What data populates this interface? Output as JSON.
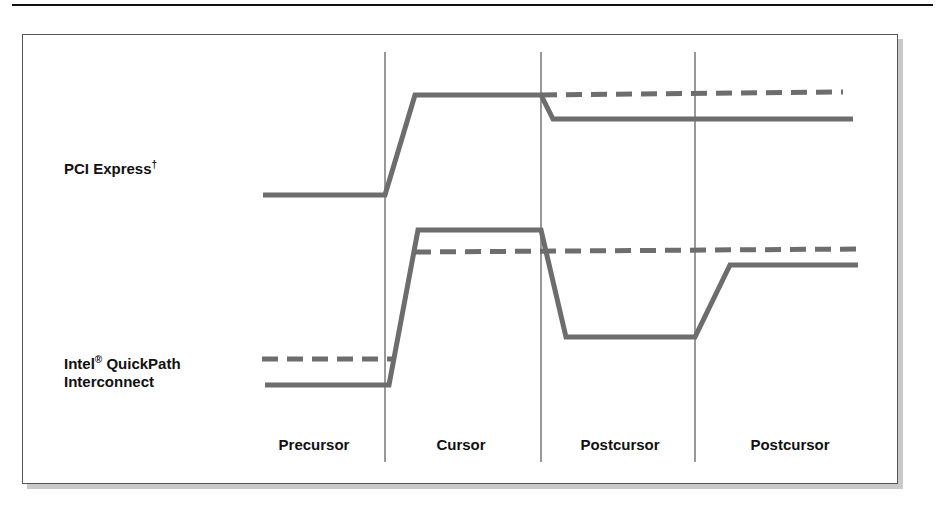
{
  "diagram": {
    "row_labels": {
      "pcie_main": "PCI Express",
      "pcie_sup": "†",
      "qpi_line1_main": "Intel",
      "qpi_line1_sup": "®",
      "qpi_line1_rest": " QuickPath",
      "qpi_line2": "Interconnect"
    },
    "columns": [
      {
        "label": "Precursor"
      },
      {
        "label": "Cursor"
      },
      {
        "label": "Postcursor"
      },
      {
        "label": "Postcursor"
      }
    ],
    "dividers_x": [
      385,
      541,
      695
    ],
    "colors": {
      "waveform": "#6d6d6d",
      "divider": "#333333",
      "frame_border": "#555555",
      "frame_shadow": "#c9c9c9",
      "text": "#111111"
    },
    "waveforms": {
      "pcie_solid": "263,195 385,195 415,95 541,95 553,119 853,119",
      "pcie_dashed": "541,95 843,92",
      "qpi_solid": "265,385 389,385 418,230 541,230 566,337 695,337 730,265 858,265",
      "qpi_dashed_low": "262,359 392,359",
      "qpi_dashed_high": "415,252 860,249"
    }
  }
}
